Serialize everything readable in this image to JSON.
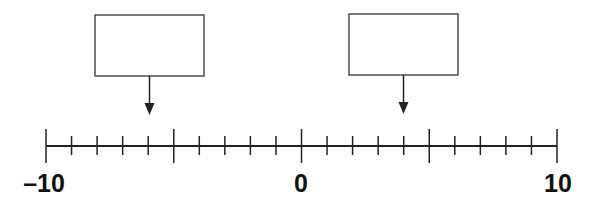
{
  "number_line": {
    "min": -10,
    "max": 10,
    "step": 1,
    "major_every": 5,
    "labels": [
      {
        "value": -10,
        "text": "–10"
      },
      {
        "value": 0,
        "text": "0"
      },
      {
        "value": 10,
        "text": "10"
      }
    ]
  },
  "answer_boxes": [
    {
      "id": "left",
      "points_to": -6,
      "value": ""
    },
    {
      "id": "right",
      "points_to": 4,
      "value": ""
    }
  ],
  "colors": {
    "ink": "#222222",
    "background": "#ffffff"
  }
}
